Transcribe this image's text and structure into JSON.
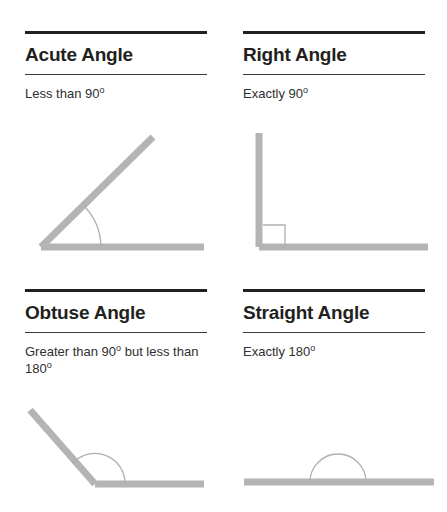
{
  "document": {
    "title": "Types of Angles",
    "accent_color": "#231f20",
    "ray_color": "#b4b4b4",
    "background_color": "#ffffff"
  },
  "panels": [
    {
      "id": "acute",
      "heading": "Acute Angle",
      "subtitle_text": "Less than 90",
      "subtitle_degree": "o",
      "subtitle_tail": "",
      "figure": "acute-angle-diagram",
      "angle_degrees": 45,
      "marker": "arc"
    },
    {
      "id": "right",
      "heading": "Right Angle",
      "subtitle_text": "Exactly 90",
      "subtitle_degree": "o",
      "subtitle_tail": "",
      "figure": "right-angle-diagram",
      "angle_degrees": 90,
      "marker": "square"
    },
    {
      "id": "obtuse",
      "heading": "Obtuse Angle",
      "subtitle_text": "Greater than 90",
      "subtitle_degree": "o",
      "subtitle_tail": " but less than 180",
      "subtitle_tail_degree": "o",
      "figure": "obtuse-angle-diagram",
      "angle_degrees": 135,
      "marker": "arc"
    },
    {
      "id": "straight",
      "heading": "Straight Angle",
      "subtitle_text": "Exactly 180",
      "subtitle_degree": "o",
      "subtitle_tail": "",
      "figure": "straight-angle-diagram",
      "angle_degrees": 180,
      "marker": "semicircle"
    }
  ]
}
